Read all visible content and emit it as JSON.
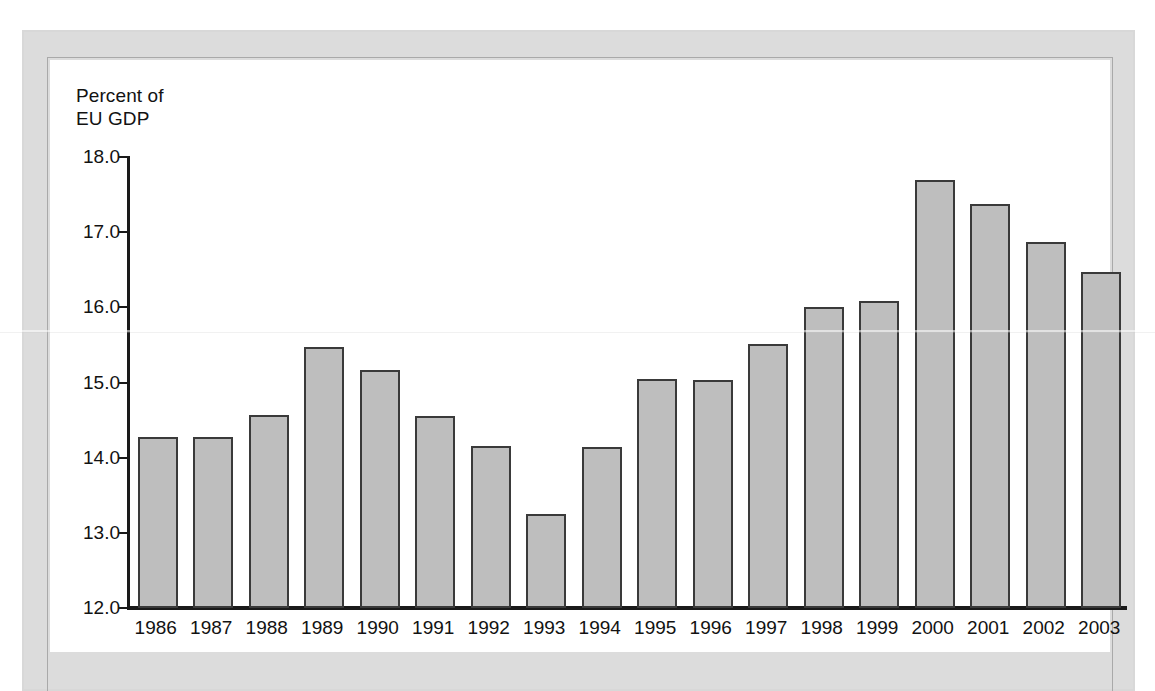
{
  "page": {
    "background_color": "#ffffff",
    "band_color": "#d8d8d8",
    "panel_color": "#ffffff",
    "border_color": "#a9a9a9"
  },
  "chart_data": {
    "type": "bar",
    "title": "",
    "subtitle": "",
    "ylabel": "Percent of\nEU GDP",
    "xlabel": "",
    "ylim": [
      12.0,
      18.0
    ],
    "yticks": [
      "12.0",
      "13.0",
      "14.0",
      "15.0",
      "16.0",
      "17.0",
      "18.0"
    ],
    "ytick_values": [
      12.0,
      13.0,
      14.0,
      15.0,
      16.0,
      17.0,
      18.0
    ],
    "grid": false,
    "legend": null,
    "bar_color": "#bebebe",
    "bar_edge_color": "#3a3a3a",
    "categories": [
      "1986",
      "1987",
      "1988",
      "1989",
      "1990",
      "1991",
      "1992",
      "1993",
      "1994",
      "1995",
      "1996",
      "1997",
      "1998",
      "1999",
      "2000",
      "2001",
      "2002",
      "2003"
    ],
    "values": [
      14.28,
      14.27,
      14.57,
      15.47,
      15.17,
      14.56,
      14.16,
      13.25,
      14.14,
      15.04,
      15.03,
      15.51,
      16.0,
      16.09,
      17.7,
      17.38,
      16.87,
      16.47
    ]
  }
}
